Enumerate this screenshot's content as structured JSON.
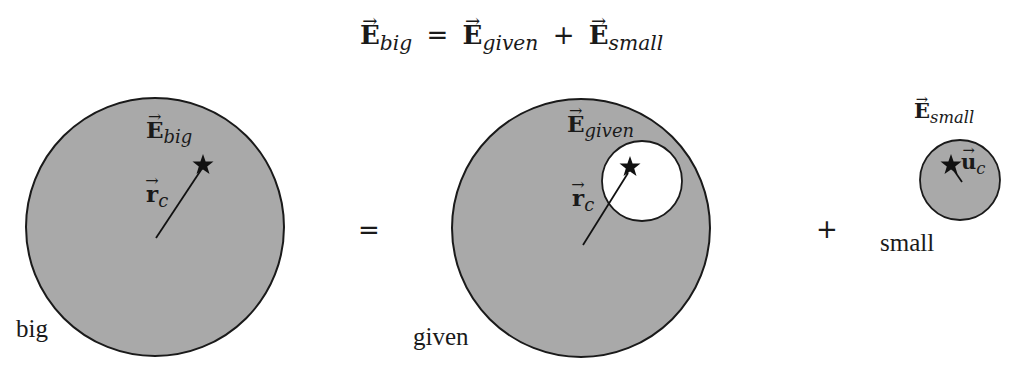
{
  "equation": {
    "lhs": {
      "symbol": "E",
      "subscript": "big"
    },
    "equals": "=",
    "term1": {
      "symbol": "E",
      "subscript": "given"
    },
    "plus": "+",
    "term2": {
      "symbol": "E",
      "subscript": "small"
    }
  },
  "panels": {
    "big": {
      "label": "big",
      "field_label": {
        "symbol": "E",
        "subscript": "big"
      },
      "vector_label": {
        "symbol": "r",
        "subscript": "c"
      }
    },
    "operator_equals": "=",
    "given": {
      "label": "given",
      "field_label": {
        "symbol": "E",
        "subscript": "given"
      },
      "vector_label": {
        "symbol": "r",
        "subscript": "c"
      }
    },
    "operator_plus": "+",
    "small": {
      "label": "small",
      "field_label": {
        "symbol": "E",
        "subscript": "small"
      },
      "vector_label": {
        "symbol": "u",
        "subscript": "c"
      }
    }
  },
  "colors": {
    "fill": "#a9a9a9",
    "stroke": "#1a1a1a",
    "hole": "#ffffff",
    "star": "#111111"
  }
}
